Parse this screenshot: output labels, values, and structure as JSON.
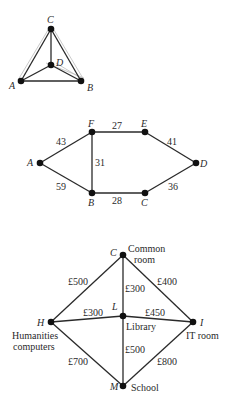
{
  "graph1": {
    "nodes": [
      {
        "id": "C",
        "label": "C"
      },
      {
        "id": "D",
        "label": "D"
      },
      {
        "id": "A",
        "label": "A"
      },
      {
        "id": "B",
        "label": "B"
      }
    ],
    "edges": [
      "A-B",
      "A-C",
      "B-C",
      "A-D",
      "B-D",
      "C-D"
    ]
  },
  "graph2": {
    "nodes": [
      {
        "id": "A",
        "label": "A"
      },
      {
        "id": "B",
        "label": "B"
      },
      {
        "id": "C",
        "label": "C"
      },
      {
        "id": "D",
        "label": "D"
      },
      {
        "id": "E",
        "label": "E"
      },
      {
        "id": "F",
        "label": "F"
      }
    ],
    "edges": [
      {
        "pair": "A-F",
        "weight": "43"
      },
      {
        "pair": "F-E",
        "weight": "27"
      },
      {
        "pair": "E-D",
        "weight": "41"
      },
      {
        "pair": "A-B",
        "weight": "59"
      },
      {
        "pair": "F-B",
        "weight": "31"
      },
      {
        "pair": "B-C",
        "weight": "28"
      },
      {
        "pair": "C-D",
        "weight": "36"
      }
    ]
  },
  "graph3": {
    "nodes": [
      {
        "id": "C",
        "label": "C",
        "desc_line1": "Common",
        "desc_line2": "room"
      },
      {
        "id": "H",
        "label": "H",
        "desc_line1": "Humanities",
        "desc_line2": "computers"
      },
      {
        "id": "L",
        "label": "L",
        "desc_line1": "Library"
      },
      {
        "id": "I",
        "label": "I",
        "desc_line1": "IT room"
      },
      {
        "id": "M",
        "label": "M",
        "desc_line1": "School"
      }
    ],
    "edges": [
      {
        "pair": "H-C",
        "weight": "£500"
      },
      {
        "pair": "C-L",
        "weight": "£300"
      },
      {
        "pair": "C-I",
        "weight": "£400"
      },
      {
        "pair": "H-L",
        "weight": "£300"
      },
      {
        "pair": "L-I",
        "weight": "£450"
      },
      {
        "pair": "H-M",
        "weight": "£700"
      },
      {
        "pair": "L-M",
        "weight": "£500"
      },
      {
        "pair": "I-M",
        "weight": "£800"
      }
    ]
  }
}
